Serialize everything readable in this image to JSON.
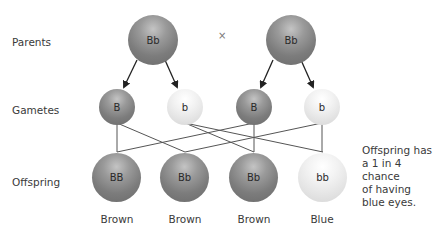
{
  "row_labels": {
    "parents": "Parents",
    "gametes": "Gametes",
    "offspring": "Offspring"
  },
  "cross_symbol": "×",
  "parents": [
    {
      "genotype": "Bb",
      "shade": "dark"
    },
    {
      "genotype": "Bb",
      "shade": "dark"
    }
  ],
  "gametes": [
    {
      "allele": "B",
      "shade": "dark"
    },
    {
      "allele": "b",
      "shade": "light"
    },
    {
      "allele": "B",
      "shade": "dark"
    },
    {
      "allele": "b",
      "shade": "light"
    }
  ],
  "offspring": [
    {
      "genotype": "BB",
      "phenotype": "Brown",
      "shade": "dark"
    },
    {
      "genotype": "Bb",
      "phenotype": "Brown",
      "shade": "dark"
    },
    {
      "genotype": "Bb",
      "phenotype": "Brown",
      "shade": "dark"
    },
    {
      "genotype": "bb",
      "phenotype": "Blue",
      "shade": "light"
    }
  ],
  "note": {
    "line1": "Offspring has",
    "line2": "a 1 in 4 chance",
    "line3": "of having",
    "line4": "blue eyes."
  }
}
